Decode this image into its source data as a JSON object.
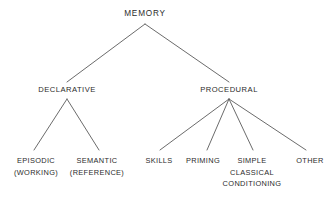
{
  "diagram": {
    "title_text": "MEMORY",
    "type_name": "memory-classification-tree",
    "stroke_color": "#5a5a5a",
    "text_color": "#2b2b2b",
    "background_color": "#ffffff",
    "root": {
      "label": "MEMORY"
    },
    "level2": [
      {
        "label": "DECLARATIVE"
      },
      {
        "label": "PROCEDURAL"
      }
    ],
    "declarative_children": [
      {
        "line1": "EPISODIC",
        "line2": "(WORKING)"
      },
      {
        "line1": "SEMANTIC",
        "line2": "(REFERENCE)"
      }
    ],
    "procedural_children": [
      {
        "line1": "SKILLS",
        "line2": "",
        "line3": ""
      },
      {
        "line1": "PRIMING",
        "line2": "",
        "line3": ""
      },
      {
        "line1": "SIMPLE",
        "line2": "CLASSICAL",
        "line3": "CONDITIONING"
      },
      {
        "line1": "OTHER",
        "line2": "",
        "line3": ""
      }
    ]
  }
}
